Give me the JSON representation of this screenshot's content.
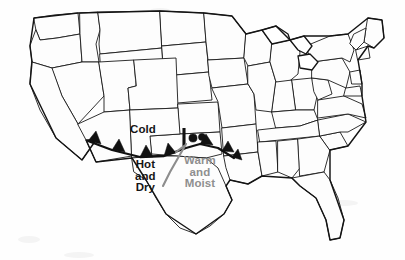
{
  "figure": {
    "kind": "weather-front-map",
    "region": "Contiguous United States",
    "background_color": "#fefefe",
    "outline_color": "#141414"
  },
  "labels": {
    "cold": "Cold",
    "hot_and_dry": "Hot\nand\nDry",
    "warm_and_moist": "Warm\nand\nMoist"
  },
  "label_colors": {
    "cold": "#151515",
    "hot_and_dry": "#151515",
    "warm_and_moist": "#8f8f8f"
  },
  "map_features": {
    "cold_front_name": "cold-front",
    "warm_front_name": "warm-front",
    "dryline_name": "dryline",
    "cold_front_color": "#111111",
    "dryline_color": "#8d8d8d"
  }
}
